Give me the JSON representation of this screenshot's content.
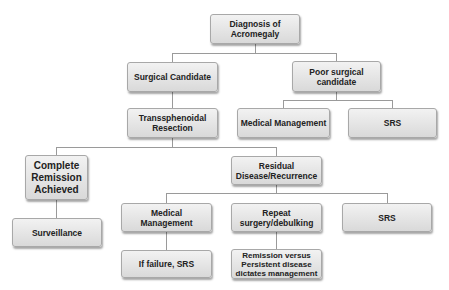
{
  "diagram": {
    "nodes": {
      "root": "Diagnosis of Acromegaly",
      "surgical": "Surgical Candidate",
      "poor": "Poor surgical candidate",
      "transsphenoidal": "Transsphenoidal Resection",
      "poor_medical": "Medical Management",
      "poor_srs": "SRS",
      "complete": "Complete Remission Achieved",
      "residual": "Residual Disease/Recurrence",
      "surveillance": "Surveillance",
      "res_medical": "Medical Management",
      "repeat": "Repeat surgery/debulking",
      "res_srs": "SRS",
      "if_failure": "If failure, SRS",
      "remission_vs": "Remission versus Persistent disease dictates management"
    },
    "edges": [
      [
        "root",
        "surgical"
      ],
      [
        "root",
        "poor"
      ],
      [
        "surgical",
        "transsphenoidal"
      ],
      [
        "poor",
        "poor_medical"
      ],
      [
        "poor",
        "poor_srs"
      ],
      [
        "transsphenoidal",
        "complete"
      ],
      [
        "transsphenoidal",
        "residual"
      ],
      [
        "complete",
        "surveillance"
      ],
      [
        "residual",
        "res_medical"
      ],
      [
        "residual",
        "repeat"
      ],
      [
        "residual",
        "res_srs"
      ],
      [
        "res_medical",
        "if_failure"
      ],
      [
        "repeat",
        "remission_vs"
      ]
    ]
  }
}
